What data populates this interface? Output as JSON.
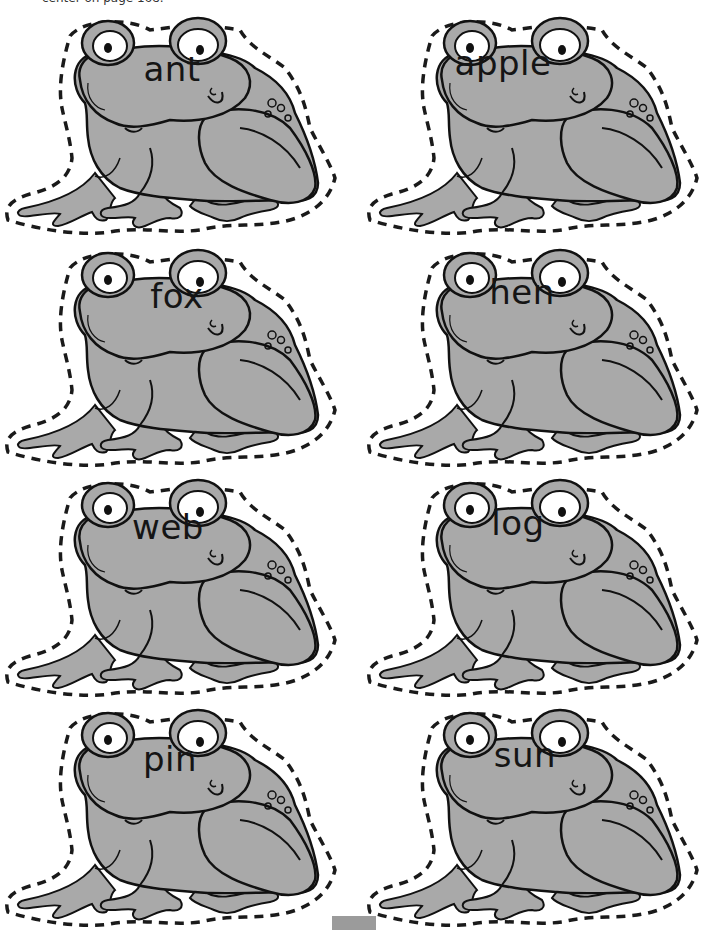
{
  "page": {
    "header_note": "center on page 168.",
    "colors": {
      "frog_fill": "#a9a9a9",
      "outline": "#111111",
      "cut_line": "#1a1a1a",
      "eye_white": "#ffffff",
      "tab": "#9b9b9b"
    }
  },
  "cards": [
    {
      "word": "ant",
      "x": 0,
      "y": 8,
      "word_x": 172,
      "word_y": 70
    },
    {
      "word": "apple",
      "x": 362,
      "y": 8,
      "word_x": 503,
      "word_y": 64
    },
    {
      "word": "fox",
      "x": 0,
      "y": 240,
      "word_x": 177,
      "word_y": 297
    },
    {
      "word": "hen",
      "x": 362,
      "y": 240,
      "word_x": 522,
      "word_y": 293
    },
    {
      "word": "web",
      "x": 0,
      "y": 470,
      "word_x": 168,
      "word_y": 528
    },
    {
      "word": "log",
      "x": 362,
      "y": 470,
      "word_x": 518,
      "word_y": 524
    },
    {
      "word": "pin",
      "x": 0,
      "y": 700,
      "word_x": 170,
      "word_y": 760
    },
    {
      "word": "sun",
      "x": 362,
      "y": 700,
      "word_x": 525,
      "word_y": 756
    }
  ]
}
